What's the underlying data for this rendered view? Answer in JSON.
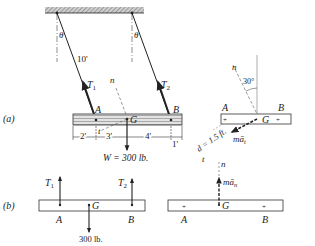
{
  "figure": {
    "part_a_label": "(a)",
    "part_b_label": "(b)",
    "colors": {
      "ink": "#222222",
      "hatch": "#9a9a9a",
      "bar_fill": "#d8d8d8"
    }
  },
  "part_a": {
    "theta_left": "θ",
    "theta_right": "θ",
    "cable_length": "10'",
    "tension_1": "T",
    "tension_1_sub": "1",
    "tension_2": "T",
    "tension_2_sub": "2",
    "normal_axis": "n",
    "tangent_axis": "t",
    "point_a": "A",
    "point_b": "B",
    "point_g": "G",
    "dims": [
      "2'",
      "3'",
      "4'",
      "1'"
    ],
    "weight": "W = 300 lb."
  },
  "part_a_kinetic": {
    "normal_axis": "n",
    "angle": "30°",
    "point_a": "A",
    "point_b": "B",
    "point_g": "G",
    "distance": "d = 1.5 ft.",
    "tangent_axis": "t",
    "inertia_t": "mā",
    "inertia_t_sub": "t"
  },
  "part_b": {
    "tension_1": "T",
    "tension_1_sub": "1",
    "tension_2": "T",
    "tension_2_sub": "2",
    "point_a": "A",
    "point_b": "B",
    "point_g": "G",
    "weight": "300 lb."
  },
  "part_b_kinetic": {
    "normal_axis": "n",
    "inertia_n": "mā",
    "inertia_n_sub": "n",
    "point_a": "A",
    "point_b": "B",
    "point_g": "G"
  }
}
